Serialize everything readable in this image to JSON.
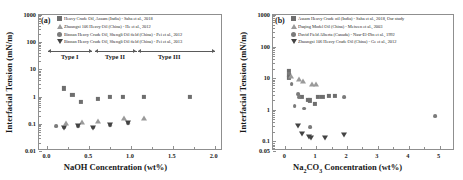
{
  "figure": {
    "panel_a_label": "(a)",
    "panel_b_label": "(b)"
  },
  "chart_data": [
    {
      "type": "scatter",
      "panel": "(a)",
      "title": "",
      "xlabel": "NaOH Concentration (wt%)",
      "ylabel": "Interfacial Tension (mN/m)",
      "yscale": "log",
      "ylim": [
        0.01,
        1000
      ],
      "yticks": [
        0.01,
        0.1,
        1,
        10,
        100,
        1000
      ],
      "ytick_labels": [
        "0.01",
        "0.1",
        "1",
        "10",
        "100",
        "1000"
      ],
      "xlim": [
        -0.1,
        2.1
      ],
      "xticks": [
        0.0,
        0.5,
        1.0,
        1.5,
        2.0
      ],
      "xtick_labels": [
        "0.0",
        "0.5",
        "1.0",
        "1.5",
        "2.0"
      ],
      "grid": false,
      "legend_position": "top-left",
      "annotations": [
        {
          "text": "Type I",
          "x": 0.28
        },
        {
          "text": "Type II",
          "x": 0.82
        },
        {
          "text": "Type III",
          "x": 1.47
        }
      ],
      "series": [
        {
          "name": "Heavy Crude Oil, Assam (India) - Saha et al., 2018",
          "marker": "square",
          "points": [
            {
              "x": 0.2,
              "y": 2.0
            },
            {
              "x": 0.3,
              "y": 1.15
            },
            {
              "x": 0.4,
              "y": 0.62
            },
            {
              "x": 0.6,
              "y": 0.8
            },
            {
              "x": 0.75,
              "y": 0.95
            },
            {
              "x": 0.9,
              "y": 1.0
            },
            {
              "x": 1.15,
              "y": 1.0
            },
            {
              "x": 1.7,
              "y": 1.0
            }
          ]
        },
        {
          "name": "Zhuangxi 106 Heavy Oil (China) - He et al., 2012",
          "marker": "triangle-up",
          "points": [
            {
              "x": 0.22,
              "y": 0.105
            },
            {
              "x": 0.42,
              "y": 0.115
            },
            {
              "x": 0.6,
              "y": 0.125
            },
            {
              "x": 0.92,
              "y": 0.16
            },
            {
              "x": 1.15,
              "y": 0.17
            }
          ]
        },
        {
          "name": "Binnan Heavy Crude Oil, Shengli Oil field (China) - Pei et al., 2012",
          "marker": "circle",
          "points": [
            {
              "x": 0.1,
              "y": 0.082
            },
            {
              "x": 0.2,
              "y": 0.072
            },
            {
              "x": 0.37,
              "y": 0.085
            },
            {
              "x": 0.55,
              "y": 0.072
            },
            {
              "x": 0.75,
              "y": 0.092
            },
            {
              "x": 0.97,
              "y": 0.105
            }
          ]
        },
        {
          "name": "Binnan Heavy Crude Oil, Shengli Oil field (China) - Pei et al., 2013",
          "marker": "triangle-down",
          "points": [
            {
              "x": 0.2,
              "y": 0.072
            },
            {
              "x": 0.37,
              "y": 0.082
            },
            {
              "x": 0.55,
              "y": 0.07
            },
            {
              "x": 0.75,
              "y": 0.09
            },
            {
              "x": 0.97,
              "y": 0.105
            }
          ]
        }
      ]
    },
    {
      "type": "scatter",
      "panel": "(b)",
      "title": "",
      "xlabel": "Na2CO3 Concentration (wt%)",
      "xlabel_parts": [
        "Na",
        "2",
        "CO",
        "3",
        " Concentration (wt%)"
      ],
      "ylabel": "Interfacial Tension (mN/m)",
      "yscale": "log",
      "ylim": [
        0.05,
        1000
      ],
      "yticks": [
        0.05,
        0.1,
        1,
        10,
        100,
        1000
      ],
      "ytick_labels": [
        "0.05",
        "0.1",
        "1",
        "10",
        "100",
        "1000"
      ],
      "xlim": [
        -0.4,
        5.5
      ],
      "xticks": [
        0,
        1,
        2,
        3,
        4,
        5
      ],
      "xtick_labels": [
        "0",
        "1",
        "2",
        "3",
        "4",
        "5"
      ],
      "grid": false,
      "legend_position": "top-left",
      "series": [
        {
          "name": "Assam Heavy Crude oil (India) - Saha et al., 2018, Our study",
          "marker": "square",
          "points": [
            {
              "x": 0.12,
              "y": 17.0
            },
            {
              "x": 0.12,
              "y": 13.0
            },
            {
              "x": 0.12,
              "y": 10.5
            },
            {
              "x": 0.55,
              "y": 2.6
            },
            {
              "x": 0.72,
              "y": 2.1
            },
            {
              "x": 0.8,
              "y": 2.0
            },
            {
              "x": 1.05,
              "y": 2.6
            },
            {
              "x": 1.2,
              "y": 2.6
            },
            {
              "x": 1.42,
              "y": 2.7
            },
            {
              "x": 1.6,
              "y": 2.7
            },
            {
              "x": 0.95,
              "y": 1.5
            }
          ]
        },
        {
          "name": "Daqing Model Oil (China) - Meiwen et al., 2003",
          "marker": "triangle-up",
          "points": [
            {
              "x": 0.18,
              "y": 12.0
            },
            {
              "x": 0.45,
              "y": 9.5
            },
            {
              "x": 0.58,
              "y": 8.0
            },
            {
              "x": 0.85,
              "y": 6.8
            },
            {
              "x": 1.0,
              "y": 6.5
            }
          ]
        },
        {
          "name": "David Field Alberta (Canada) - Nasr-El-Din et al., 1992",
          "marker": "circle",
          "points": [
            {
              "x": 0.12,
              "y": 14.0
            },
            {
              "x": 0.2,
              "y": 6.5
            },
            {
              "x": 0.42,
              "y": 3.1
            },
            {
              "x": 0.45,
              "y": 2.6
            },
            {
              "x": 0.3,
              "y": 1.3
            },
            {
              "x": 1.9,
              "y": 2.6
            },
            {
              "x": 0.62,
              "y": 1.1
            },
            {
              "x": 4.85,
              "y": 0.62
            },
            {
              "x": 0.8,
              "y": 0.28
            }
          ]
        },
        {
          "name": "Zhuangxi 106 Heavy Crude Oil (China) - Ge et al., 2012",
          "marker": "triangle-down",
          "points": [
            {
              "x": 0.42,
              "y": 0.3
            },
            {
              "x": 0.55,
              "y": 0.17
            },
            {
              "x": 0.78,
              "y": 0.135
            },
            {
              "x": 0.82,
              "y": 0.125
            },
            {
              "x": 1.3,
              "y": 0.125
            },
            {
              "x": 1.9,
              "y": 0.155
            }
          ]
        }
      ]
    }
  ]
}
